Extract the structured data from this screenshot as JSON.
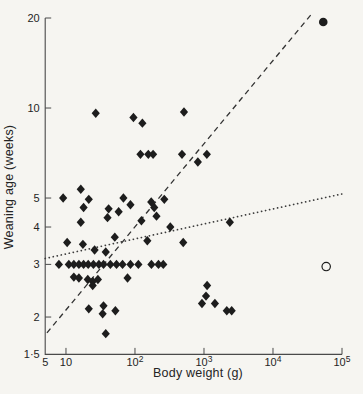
{
  "figure": {
    "background": "#f6f5f1",
    "ink": "#1d1d1d",
    "axis_color": "#4a4a4a"
  },
  "chart_data": {
    "type": "scatter",
    "title": "",
    "xlabel": "Body weight (g)",
    "ylabel": "Weaning age (weeks)",
    "x_scale": "log",
    "y_scale": "log",
    "xlim": [
      5,
      100000
    ],
    "ylim": [
      1.5,
      20
    ],
    "grid": false,
    "x_ticks": [
      {
        "v": 5,
        "base": "5",
        "sup": ""
      },
      {
        "v": 10,
        "base": "10",
        "sup": ""
      },
      {
        "v": 100,
        "base": "10",
        "sup": "2"
      },
      {
        "v": 1000,
        "base": "10",
        "sup": "3"
      },
      {
        "v": 10000,
        "base": "10",
        "sup": "4"
      },
      {
        "v": 100000,
        "base": "10",
        "sup": "5"
      }
    ],
    "y_ticks": [
      {
        "v": 20,
        "label": "20"
      },
      {
        "v": 10,
        "label": "10"
      },
      {
        "v": 5,
        "label": "5"
      },
      {
        "v": 4,
        "label": "4"
      },
      {
        "v": 3,
        "label": "3"
      },
      {
        "v": 2,
        "label": "2"
      },
      {
        "v": 1.5,
        "label": "1·5"
      }
    ],
    "series": [
      {
        "name": "species-filled-diamonds",
        "marker": "diamond",
        "points": [
          [
            27,
            9.6
          ],
          [
            95,
            9.3
          ],
          [
            128,
            8.9
          ],
          [
            513,
            9.7
          ],
          [
            120,
            7.0
          ],
          [
            156,
            7.0
          ],
          [
            183,
            7.0
          ],
          [
            480,
            7.0
          ],
          [
            1100,
            7.0
          ],
          [
            815,
            6.6
          ],
          [
            9.1,
            5.0
          ],
          [
            16.4,
            5.35
          ],
          [
            21.4,
            4.95
          ],
          [
            18,
            4.65
          ],
          [
            68,
            5.0
          ],
          [
            86,
            4.75
          ],
          [
            41.5,
            4.6
          ],
          [
            58,
            4.5
          ],
          [
            40,
            4.3
          ],
          [
            16.4,
            4.15
          ],
          [
            124,
            4.2
          ],
          [
            172,
            4.85
          ],
          [
            266,
            4.95
          ],
          [
            190,
            4.65
          ],
          [
            205,
            4.35
          ],
          [
            325,
            4.0
          ],
          [
            2370,
            4.15
          ],
          [
            51,
            3.7
          ],
          [
            10.4,
            3.55
          ],
          [
            17.6,
            3.5
          ],
          [
            26,
            3.35
          ],
          [
            37.7,
            3.3
          ],
          [
            151,
            3.6
          ],
          [
            500,
            3.55
          ],
          [
            7.9,
            3.0
          ],
          [
            11,
            3.0
          ],
          [
            13,
            3.0
          ],
          [
            15.4,
            3.0
          ],
          [
            18,
            3.0
          ],
          [
            21,
            3.0
          ],
          [
            25,
            3.0
          ],
          [
            30,
            3.0
          ],
          [
            35,
            3.0
          ],
          [
            44,
            3.0
          ],
          [
            54,
            3.0
          ],
          [
            66,
            3.0
          ],
          [
            86,
            3.0
          ],
          [
            112,
            3.0
          ],
          [
            173,
            3.0
          ],
          [
            219,
            3.0
          ],
          [
            257,
            3.0
          ],
          [
            13,
            2.72
          ],
          [
            15.4,
            2.7
          ],
          [
            20.7,
            2.67
          ],
          [
            29,
            2.67
          ],
          [
            24.4,
            2.63
          ],
          [
            24.4,
            2.55
          ],
          [
            78,
            2.7
          ],
          [
            21.4,
            2.13
          ],
          [
            35,
            2.18
          ],
          [
            34,
            2.05
          ],
          [
            52,
            2.1
          ],
          [
            37.7,
            1.76
          ],
          [
            1110,
            2.55
          ],
          [
            1070,
            2.35
          ],
          [
            935,
            2.22
          ],
          [
            1440,
            2.22
          ],
          [
            2140,
            2.1
          ],
          [
            2520,
            2.1
          ]
        ]
      },
      {
        "name": "filled-circle-outlier",
        "marker": "circle-filled",
        "points": [
          [
            53500,
            19.4
          ]
        ]
      },
      {
        "name": "open-circle-outlier",
        "marker": "circle-open",
        "points": [
          [
            59000,
            2.95
          ]
        ]
      }
    ],
    "lines": [
      {
        "name": "dashed-regression-line",
        "style": "dashed",
        "from": [
          5.3,
          1.77
        ],
        "to": [
          35500,
          20.5
        ]
      },
      {
        "name": "dotted-regression-line",
        "style": "dotted",
        "from": [
          5.0,
          3.14
        ],
        "to": [
          100000,
          5.16
        ]
      }
    ]
  }
}
